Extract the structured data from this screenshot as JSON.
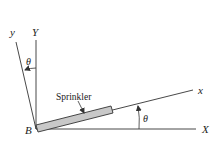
{
  "diagram": {
    "labels": {
      "origin": "B",
      "fixed_x": "X",
      "fixed_y": "Y",
      "rotated_x": "x",
      "rotated_y": "y",
      "angle_top": "θ",
      "angle_right": "θ",
      "sprinkler": "Sprinkler"
    },
    "colors": {
      "line": "#333333",
      "sprinkler_fill": "#c8c8c8"
    }
  }
}
